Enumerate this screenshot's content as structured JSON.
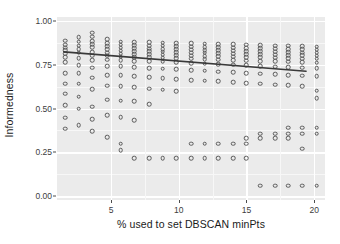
{
  "chart_data": {
    "type": "scatter",
    "title": "",
    "xlabel": "% used to set DBSCAN minPts",
    "ylabel": "Informedness",
    "xlim": [
      1.0,
      20.8
    ],
    "ylim": [
      -0.02,
      1.02
    ],
    "xticks": [
      5,
      10,
      15,
      20
    ],
    "xtick_labels": [
      "5",
      "10",
      "15",
      "20"
    ],
    "yticks": [
      0.0,
      0.25,
      0.5,
      0.75,
      1.0
    ],
    "ytick_labels": [
      "0.00",
      "0.25",
      "0.50",
      "0.75",
      "1.00"
    ],
    "grid": true,
    "legend": "none",
    "marker": "open-circle",
    "panel_color": "#ebebeb",
    "grid_color": "#ffffff",
    "point_color": "#595959",
    "trend_color": "#3a3a3a",
    "trend_line": {
      "name": "linear fit",
      "x": [
        1.5,
        19.4
      ],
      "y": [
        0.822,
        0.712
      ]
    },
    "series": [
      {
        "name": "Informedness vs minPts %",
        "points": [
          [
            1.6,
            0.885
          ],
          [
            1.6,
            0.862
          ],
          [
            1.6,
            0.845
          ],
          [
            1.6,
            0.83
          ],
          [
            1.6,
            0.812
          ],
          [
            1.6,
            0.793
          ],
          [
            1.6,
            0.762
          ],
          [
            1.6,
            0.7
          ],
          [
            1.6,
            0.642
          ],
          [
            1.6,
            0.585
          ],
          [
            1.6,
            0.52
          ],
          [
            1.6,
            0.448
          ],
          [
            1.6,
            0.385
          ],
          [
            2.6,
            0.905
          ],
          [
            2.6,
            0.88
          ],
          [
            2.6,
            0.858
          ],
          [
            2.6,
            0.838
          ],
          [
            2.6,
            0.818
          ],
          [
            2.6,
            0.786
          ],
          [
            2.6,
            0.745
          ],
          [
            2.6,
            0.7
          ],
          [
            2.6,
            0.64
          ],
          [
            2.6,
            0.566
          ],
          [
            2.6,
            0.5
          ],
          [
            2.6,
            0.404
          ],
          [
            3.6,
            0.93
          ],
          [
            3.6,
            0.908
          ],
          [
            3.6,
            0.884
          ],
          [
            3.6,
            0.866
          ],
          [
            3.6,
            0.847
          ],
          [
            3.6,
            0.82
          ],
          [
            3.6,
            0.8
          ],
          [
            3.6,
            0.775
          ],
          [
            3.6,
            0.733
          ],
          [
            3.6,
            0.676
          ],
          [
            3.6,
            0.61
          ],
          [
            3.6,
            0.51
          ],
          [
            3.6,
            0.44
          ],
          [
            3.6,
            0.372
          ],
          [
            4.7,
            0.895
          ],
          [
            4.7,
            0.872
          ],
          [
            4.7,
            0.855
          ],
          [
            4.7,
            0.838
          ],
          [
            4.7,
            0.818
          ],
          [
            4.7,
            0.8
          ],
          [
            4.7,
            0.778
          ],
          [
            4.7,
            0.742
          ],
          [
            4.7,
            0.69
          ],
          [
            4.7,
            0.63
          ],
          [
            4.7,
            0.55
          ],
          [
            4.7,
            0.462
          ],
          [
            4.7,
            0.338
          ],
          [
            5.7,
            0.88
          ],
          [
            5.7,
            0.862
          ],
          [
            5.7,
            0.845
          ],
          [
            5.7,
            0.828
          ],
          [
            5.7,
            0.812
          ],
          [
            5.7,
            0.795
          ],
          [
            5.7,
            0.775
          ],
          [
            5.7,
            0.74
          ],
          [
            5.7,
            0.69
          ],
          [
            5.7,
            0.628
          ],
          [
            5.7,
            0.545
          ],
          [
            5.7,
            0.45
          ],
          [
            5.7,
            0.3
          ],
          [
            5.7,
            0.262
          ],
          [
            6.7,
            0.878
          ],
          [
            6.7,
            0.86
          ],
          [
            6.7,
            0.843
          ],
          [
            6.7,
            0.826
          ],
          [
            6.7,
            0.81
          ],
          [
            6.7,
            0.792
          ],
          [
            6.7,
            0.77
          ],
          [
            6.7,
            0.735
          ],
          [
            6.7,
            0.682
          ],
          [
            6.7,
            0.62
          ],
          [
            6.7,
            0.54
          ],
          [
            6.7,
            0.432
          ],
          [
            6.7,
            0.218
          ],
          [
            7.8,
            0.876
          ],
          [
            7.8,
            0.858
          ],
          [
            7.8,
            0.84
          ],
          [
            7.8,
            0.824
          ],
          [
            7.8,
            0.808
          ],
          [
            7.8,
            0.79
          ],
          [
            7.8,
            0.768
          ],
          [
            7.8,
            0.73
          ],
          [
            7.8,
            0.678
          ],
          [
            7.8,
            0.612
          ],
          [
            7.8,
            0.525
          ],
          [
            7.8,
            0.218
          ],
          [
            8.8,
            0.874
          ],
          [
            8.8,
            0.856
          ],
          [
            8.8,
            0.838
          ],
          [
            8.8,
            0.822
          ],
          [
            8.8,
            0.805
          ],
          [
            8.8,
            0.788
          ],
          [
            8.8,
            0.765
          ],
          [
            8.8,
            0.726
          ],
          [
            8.8,
            0.672
          ],
          [
            8.8,
            0.606
          ],
          [
            8.8,
            0.218
          ],
          [
            9.8,
            0.872
          ],
          [
            9.8,
            0.854
          ],
          [
            9.8,
            0.836
          ],
          [
            9.8,
            0.82
          ],
          [
            9.8,
            0.802
          ],
          [
            9.8,
            0.785
          ],
          [
            9.8,
            0.762
          ],
          [
            9.8,
            0.722
          ],
          [
            9.8,
            0.668
          ],
          [
            9.8,
            0.598
          ],
          [
            9.8,
            0.218
          ],
          [
            10.9,
            0.87
          ],
          [
            10.9,
            0.852
          ],
          [
            10.9,
            0.834
          ],
          [
            10.9,
            0.818
          ],
          [
            10.9,
            0.8
          ],
          [
            10.9,
            0.782
          ],
          [
            10.9,
            0.758
          ],
          [
            10.9,
            0.718
          ],
          [
            10.9,
            0.662
          ],
          [
            10.9,
            0.3
          ],
          [
            10.9,
            0.218
          ],
          [
            11.9,
            0.868
          ],
          [
            11.9,
            0.85
          ],
          [
            11.9,
            0.832
          ],
          [
            11.9,
            0.816
          ],
          [
            11.9,
            0.798
          ],
          [
            11.9,
            0.78
          ],
          [
            11.9,
            0.755
          ],
          [
            11.9,
            0.714
          ],
          [
            11.9,
            0.658
          ],
          [
            11.9,
            0.3
          ],
          [
            11.9,
            0.218
          ],
          [
            12.9,
            0.866
          ],
          [
            12.9,
            0.848
          ],
          [
            12.9,
            0.83
          ],
          [
            12.9,
            0.814
          ],
          [
            12.9,
            0.796
          ],
          [
            12.9,
            0.778
          ],
          [
            12.9,
            0.752
          ],
          [
            12.9,
            0.71
          ],
          [
            12.9,
            0.654
          ],
          [
            12.9,
            0.3
          ],
          [
            12.9,
            0.218
          ],
          [
            14.0,
            0.864
          ],
          [
            14.0,
            0.846
          ],
          [
            14.0,
            0.828
          ],
          [
            14.0,
            0.812
          ],
          [
            14.0,
            0.794
          ],
          [
            14.0,
            0.775
          ],
          [
            14.0,
            0.748
          ],
          [
            14.0,
            0.706
          ],
          [
            14.0,
            0.648
          ],
          [
            14.0,
            0.3
          ],
          [
            14.0,
            0.218
          ],
          [
            15.0,
            0.862
          ],
          [
            15.0,
            0.844
          ],
          [
            15.0,
            0.826
          ],
          [
            15.0,
            0.81
          ],
          [
            15.0,
            0.792
          ],
          [
            15.0,
            0.772
          ],
          [
            15.0,
            0.745
          ],
          [
            15.0,
            0.702
          ],
          [
            15.0,
            0.645
          ],
          [
            15.0,
            0.33
          ],
          [
            15.0,
            0.3
          ],
          [
            15.0,
            0.218
          ],
          [
            16.0,
            0.86
          ],
          [
            16.0,
            0.842
          ],
          [
            16.0,
            0.824
          ],
          [
            16.0,
            0.808
          ],
          [
            16.0,
            0.79
          ],
          [
            16.0,
            0.77
          ],
          [
            16.0,
            0.742
          ],
          [
            16.0,
            0.698
          ],
          [
            16.0,
            0.64
          ],
          [
            16.0,
            0.356
          ],
          [
            16.0,
            0.33
          ],
          [
            16.0,
            0.062
          ],
          [
            17.1,
            0.858
          ],
          [
            17.1,
            0.84
          ],
          [
            17.1,
            0.822
          ],
          [
            17.1,
            0.806
          ],
          [
            17.1,
            0.788
          ],
          [
            17.1,
            0.768
          ],
          [
            17.1,
            0.738
          ],
          [
            17.1,
            0.694
          ],
          [
            17.1,
            0.636
          ],
          [
            17.1,
            0.356
          ],
          [
            17.1,
            0.33
          ],
          [
            17.1,
            0.062
          ],
          [
            18.1,
            0.856
          ],
          [
            18.1,
            0.838
          ],
          [
            18.1,
            0.82
          ],
          [
            18.1,
            0.804
          ],
          [
            18.1,
            0.786
          ],
          [
            18.1,
            0.765
          ],
          [
            18.1,
            0.735
          ],
          [
            18.1,
            0.69
          ],
          [
            18.1,
            0.632
          ],
          [
            18.1,
            0.39
          ],
          [
            18.1,
            0.356
          ],
          [
            18.1,
            0.33
          ],
          [
            18.1,
            0.062
          ],
          [
            19.1,
            0.854
          ],
          [
            19.1,
            0.836
          ],
          [
            19.1,
            0.818
          ],
          [
            19.1,
            0.802
          ],
          [
            19.1,
            0.784
          ],
          [
            19.1,
            0.762
          ],
          [
            19.1,
            0.732
          ],
          [
            19.1,
            0.686
          ],
          [
            19.1,
            0.628
          ],
          [
            19.1,
            0.39
          ],
          [
            19.1,
            0.356
          ],
          [
            19.1,
            0.272
          ],
          [
            19.1,
            0.062
          ],
          [
            20.2,
            0.852
          ],
          [
            20.2,
            0.834
          ],
          [
            20.2,
            0.816
          ],
          [
            20.2,
            0.8
          ],
          [
            20.2,
            0.782
          ],
          [
            20.2,
            0.76
          ],
          [
            20.2,
            0.728
          ],
          [
            20.2,
            0.682
          ],
          [
            20.2,
            0.6
          ],
          [
            20.2,
            0.56
          ],
          [
            20.2,
            0.39
          ],
          [
            20.2,
            0.356
          ],
          [
            20.2,
            0.062
          ]
        ]
      }
    ]
  }
}
